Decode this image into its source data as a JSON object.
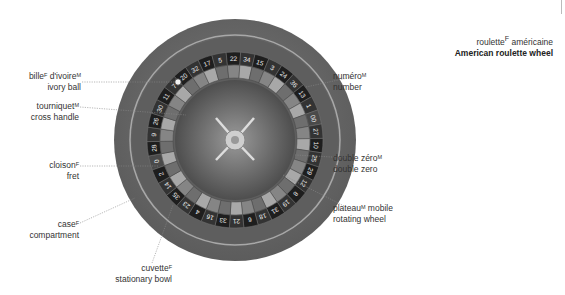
{
  "title": {
    "fr": "roulette",
    "fr_gender": "F",
    "fr_rest": " américaine",
    "en": "American roulette wheel"
  },
  "labels": [
    {
      "id": "ivory-ball",
      "fr": "bille",
      "g1": "F",
      "fr2": " d'ivoire",
      "g2": "M",
      "en": "ivory ball"
    },
    {
      "id": "cross-handle",
      "fr": "tourniquet",
      "g1": "M",
      "en": "cross handle"
    },
    {
      "id": "fret",
      "fr": "cloison",
      "g1": "F",
      "en": "fret"
    },
    {
      "id": "compartment",
      "fr": "case",
      "g1": "F",
      "en": "compartment"
    },
    {
      "id": "stationary-bowl",
      "fr": "cuvette",
      "g1": "F",
      "en": "stationary bowl"
    },
    {
      "id": "number",
      "fr": "numéro",
      "g1": "M",
      "en": "number"
    },
    {
      "id": "double-zero",
      "fr": "double zéro",
      "g1": "M",
      "en": "double zero"
    },
    {
      "id": "rotating-wheel",
      "fr": "plateau",
      "g1": "M",
      "fr2": " mobile",
      "en": "rotating wheel"
    }
  ],
  "wheel_numbers": [
    "0",
    "28",
    "9",
    "26",
    "30",
    "11",
    "7",
    "20",
    "32",
    "17",
    "5",
    "22",
    "34",
    "15",
    "3",
    "24",
    "36",
    "13",
    "1",
    "00",
    "27",
    "10",
    "25",
    "29",
    "12",
    "8",
    "19",
    "31",
    "18",
    "6",
    "21",
    "33",
    "16",
    "4",
    "23",
    "35",
    "14",
    "2"
  ],
  "colors": {
    "outer": "#6e6e6e",
    "rim": "#8a8a8a",
    "bowl": "#5a5a5a",
    "pocket_dark": "#2b2b2b",
    "pocket_light": "#9a9a9a",
    "hub": "#c9c9c9"
  }
}
